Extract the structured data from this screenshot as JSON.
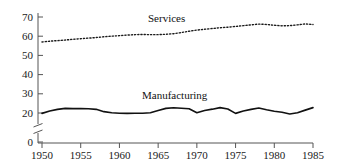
{
  "chart_data": {
    "type": "line",
    "title": "",
    "subtitle": "",
    "xlabel": "",
    "ylabel": "",
    "xlim": [
      1950,
      1985
    ],
    "ylim": [
      20,
      70
    ],
    "y_axis_break": true,
    "y_break_note": "axis broken between 0 and 20",
    "y_zero_shown": true,
    "grid": false,
    "legend_position": "inline-annotation",
    "xticks": [
      1950,
      1955,
      1960,
      1965,
      1970,
      1975,
      1980,
      1985
    ],
    "xtick_labels": [
      "1950",
      "1955",
      "1960",
      "1965",
      "1970",
      "1975",
      "1980",
      "1985"
    ],
    "yticks": [
      0,
      20,
      30,
      40,
      50,
      60,
      70
    ],
    "ytick_labels": [
      "0",
      "20",
      "30",
      "40",
      "50",
      "60",
      "70"
    ],
    "x": [
      1950,
      1951,
      1952,
      1953,
      1954,
      1955,
      1956,
      1957,
      1958,
      1959,
      1960,
      1961,
      1962,
      1963,
      1964,
      1965,
      1966,
      1967,
      1968,
      1969,
      1970,
      1971,
      1972,
      1973,
      1974,
      1975,
      1976,
      1977,
      1978,
      1979,
      1980,
      1981,
      1982,
      1983,
      1984,
      1985
    ],
    "series": [
      {
        "name": "Services",
        "style": "dotted",
        "color": "#1a1a1a",
        "label_text": "Services",
        "values": [
          57.0,
          57.4,
          57.7,
          58.0,
          58.4,
          58.7,
          59.0,
          59.3,
          59.7,
          60.0,
          60.3,
          60.6,
          60.8,
          60.9,
          60.8,
          60.8,
          61.0,
          61.3,
          61.9,
          62.6,
          63.2,
          63.6,
          64.0,
          64.4,
          64.7,
          65.1,
          65.5,
          65.9,
          66.3,
          66.1,
          65.7,
          65.4,
          65.5,
          65.9,
          66.4,
          66.1
        ]
      },
      {
        "name": "Manufacturing",
        "style": "solid",
        "color": "#111111",
        "label_text": "Manufacturing",
        "values": [
          19.8,
          21.0,
          21.9,
          22.4,
          22.3,
          22.3,
          22.2,
          21.9,
          20.7,
          20.1,
          19.9,
          19.8,
          19.9,
          19.9,
          20.1,
          21.3,
          22.4,
          22.7,
          22.5,
          22.2,
          20.1,
          21.3,
          22.0,
          22.8,
          22.1,
          19.8,
          21.0,
          21.9,
          22.6,
          21.7,
          20.9,
          20.4,
          19.5,
          20.1,
          21.5,
          22.8
        ]
      }
    ]
  }
}
